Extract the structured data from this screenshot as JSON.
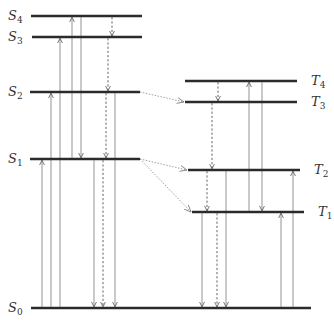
{
  "diagram": {
    "title": "",
    "type": "jablonski",
    "levels": [
      {
        "id": "S4",
        "letter": "S",
        "sub": "4",
        "y": 16,
        "x1": 31,
        "x2": 142,
        "label_side": "left"
      },
      {
        "id": "S3",
        "letter": "S",
        "sub": "3",
        "y": 37,
        "x1": 32,
        "x2": 142,
        "label_side": "left"
      },
      {
        "id": "S2",
        "letter": "S",
        "sub": "2",
        "y": 92,
        "x1": 30,
        "x2": 140,
        "label_side": "left"
      },
      {
        "id": "S1",
        "letter": "S",
        "sub": "1",
        "y": 159,
        "x1": 30,
        "x2": 140,
        "label_side": "left"
      },
      {
        "id": "S0",
        "letter": "S",
        "sub": "0",
        "y": 308,
        "x1": 31,
        "x2": 311,
        "label_side": "left"
      },
      {
        "id": "T4",
        "letter": "T",
        "sub": "4",
        "y": 81,
        "x1": 185,
        "x2": 297,
        "label_side": "right"
      },
      {
        "id": "T3",
        "letter": "T",
        "sub": "3",
        "y": 102,
        "x1": 185,
        "x2": 297,
        "label_side": "right"
      },
      {
        "id": "T2",
        "letter": "T",
        "sub": "2",
        "y": 170,
        "x1": 188,
        "x2": 300,
        "label_side": "right"
      },
      {
        "id": "T1",
        "letter": "T",
        "sub": "1",
        "y": 212,
        "x1": 192,
        "x2": 304,
        "label_side": "right"
      }
    ],
    "transitions": [
      {
        "from": "S0",
        "to": "S1",
        "x": 42,
        "style": "solid",
        "meaning": "absorption"
      },
      {
        "from": "S0",
        "to": "S2",
        "x": 51,
        "style": "solid",
        "meaning": "absorption"
      },
      {
        "from": "S0",
        "to": "S3",
        "x": 60,
        "style": "solid",
        "meaning": "absorption"
      },
      {
        "from": "S1",
        "to": "S4",
        "x": 72,
        "style": "solid",
        "meaning": "absorption"
      },
      {
        "from": "S4",
        "to": "S1",
        "x": 81,
        "style": "solid",
        "meaning": "emission"
      },
      {
        "from": "S1",
        "to": "S0",
        "x": 94,
        "style": "solid",
        "meaning": "fluorescence"
      },
      {
        "from": "S1",
        "to": "S0",
        "x": 103,
        "style": "dashed",
        "meaning": "internal conversion"
      },
      {
        "from": "S2",
        "to": "S1",
        "x": 106,
        "style": "dashed",
        "meaning": "internal conversion"
      },
      {
        "from": "S3",
        "to": "S2",
        "x": 108,
        "style": "dashed",
        "meaning": "internal conversion"
      },
      {
        "from": "S4",
        "to": "S3",
        "x": 112,
        "style": "dashed",
        "meaning": "internal conversion"
      },
      {
        "from": "S2",
        "to": "S0",
        "x": 115,
        "style": "solid",
        "meaning": "emission"
      },
      {
        "from": "T4",
        "to": "T3",
        "x": 218,
        "style": "dashed",
        "meaning": "internal conversion"
      },
      {
        "from": "T3",
        "to": "T2",
        "x": 212,
        "style": "dashed",
        "meaning": "internal conversion"
      },
      {
        "from": "T2",
        "to": "T1",
        "x": 207,
        "style": "dashed",
        "meaning": "internal conversion"
      },
      {
        "from": "T1",
        "to": "T4",
        "x": 249,
        "style": "solid",
        "meaning": "triplet absorption"
      },
      {
        "from": "T4",
        "to": "T1",
        "x": 262,
        "style": "solid",
        "meaning": "emission"
      },
      {
        "from": "T1",
        "to": "S0",
        "x": 202,
        "style": "solid",
        "meaning": "phosphorescence"
      },
      {
        "from": "T1",
        "to": "S0",
        "x": 217,
        "style": "dashed",
        "meaning": "intersystem crossing"
      },
      {
        "from": "T2",
        "to": "S0",
        "x": 226,
        "style": "solid",
        "meaning": "phosphorescence"
      },
      {
        "from": "S0",
        "to": "T1",
        "x": 281,
        "style": "solid",
        "meaning": "absorption"
      },
      {
        "from": "S0",
        "to": "T2",
        "x": 293,
        "style": "solid",
        "meaning": "absorption"
      }
    ],
    "intersystem_crossings": [
      {
        "from": "S2",
        "to": "T3",
        "x1": 140,
        "y1": 92,
        "x2": 185,
        "y2": 102
      },
      {
        "from": "S1",
        "to": "T2",
        "x1": 140,
        "y1": 159,
        "x2": 188,
        "y2": 170
      },
      {
        "from": "S1",
        "to": "T1",
        "x1": 140,
        "y1": 159,
        "x2": 192,
        "y2": 212
      }
    ]
  }
}
